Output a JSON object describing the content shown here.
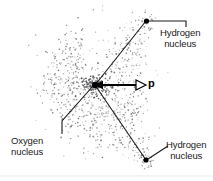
{
  "figure": {
    "type": "water-molecule-dipole-diagram",
    "background_color": "#ffffff",
    "ink_color": "#1a1a1a",
    "cloud_dot_color": "#55555a"
  },
  "labels": {
    "hydrogen_top": {
      "line1": "Hydrogen",
      "line2": "nucleus"
    },
    "hydrogen_bottom": {
      "line1": "Hydrogen",
      "line2": "nucleus"
    },
    "oxygen": {
      "line1": "Oxygen",
      "line2": "nucleus"
    },
    "dipole_vector": "p"
  },
  "nuclei": [
    {
      "name": "oxygen-nucleus",
      "x": 95,
      "y": 85,
      "r": 3.1
    },
    {
      "name": "hydrogen-nucleus-top",
      "x": 146.5,
      "y": 21,
      "r": 2.6
    },
    {
      "name": "hydrogen-nucleus-bottom",
      "x": 146,
      "y": 160,
      "r": 2.6
    }
  ],
  "bonds": [
    {
      "name": "bond-oxygen-hydrogen-top",
      "x1": 95,
      "y1": 85,
      "x2": 146,
      "y2": 21
    },
    {
      "name": "bond-oxygen-hydrogen-bottom",
      "x1": 95,
      "y1": 85,
      "x2": 146,
      "y2": 160
    }
  ],
  "dipole_arrow": {
    "x1": 95,
    "y1": 85,
    "x2": 145,
    "y2": 85,
    "left_head": "solid",
    "right_head": "hollow"
  },
  "leaders": [
    {
      "name": "leader-hydrogen-top",
      "points": "147,21 186,21 186,27"
    },
    {
      "name": "leader-hydrogen-bottom",
      "points": "148,159 168,146"
    },
    {
      "name": "leader-oxygen",
      "points": "93,86 62,121 62,134"
    }
  ],
  "bottom_rule": {
    "y": 176,
    "color": "#f0f0f2"
  },
  "electron_cloud": {
    "description": "stippled electron probability cloud around the oxygen and along the two O-H bonds",
    "seed": 20240517,
    "core_dots": 210,
    "shell_dots": 330,
    "lobe_dots": 260
  }
}
